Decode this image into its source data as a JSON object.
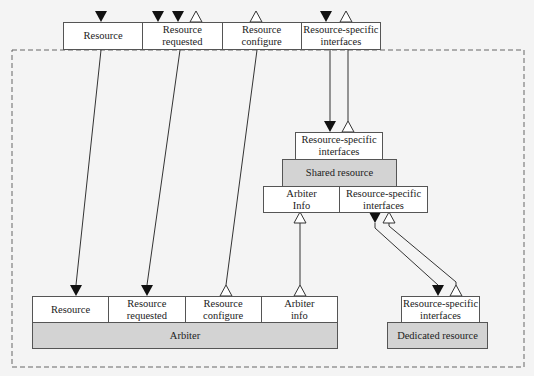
{
  "top_interface": {
    "cells": [
      "Resource",
      "Resource\nrequested",
      "Resource\nconfigure",
      "Resource-specific\ninterfaces"
    ]
  },
  "shared": {
    "interfaces_label": "Resource-specific\ninterfaces",
    "title": "Shared resource",
    "bottom_cells": [
      "Arbiter\nInfo",
      "Resource-specific\ninterfaces"
    ]
  },
  "arbiter": {
    "cells": [
      "Resource",
      "Resource\nrequested",
      "Resource\nconfigure",
      "Arbiter\ninfo"
    ],
    "title": "Arbiter"
  },
  "dedicated": {
    "interfaces_label": "Resource-specific\ninterfaces",
    "title": "Dedicated resource"
  },
  "colors": {
    "line": "#333333",
    "box_fill": "#ffffff",
    "component_fill": "#d3d3d3",
    "background": "#f4f4f4"
  }
}
